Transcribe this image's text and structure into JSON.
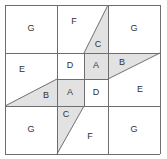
{
  "figure": {
    "name": "pinwheel-dissection-puzzle",
    "background_color": "#ffffff",
    "line_color": "#6e6e6e",
    "shade_color": "#e2e2e2",
    "label_color": "#333333",
    "frame": {
      "x0": 5,
      "y0": 5,
      "x1": 160,
      "y1": 154
    },
    "grid": {
      "vertical_x": [
        5,
        57,
        108,
        160
      ],
      "horizontal_y": [
        5,
        53,
        106,
        154
      ],
      "inner_vertical_x": [
        84
      ],
      "inner_horizontal_y": [
        79
      ]
    }
  },
  "pieces": [
    {
      "id": "g-top-left",
      "label": "G",
      "shaded": false,
      "lx": 31,
      "ly": 29,
      "points": "5,5 57,5 57,53 5,53"
    },
    {
      "id": "f-top",
      "label": "F",
      "shaded": false,
      "lx": 74,
      "ly": 22,
      "points": "57,5 108,5 84,53 57,53"
    },
    {
      "id": "c-top",
      "label": "C",
      "shaded": true,
      "lx": 98,
      "ly": 45,
      "points": "108,5 108,53 84,53"
    },
    {
      "id": "g-top-right",
      "label": "G",
      "shaded": false,
      "lx": 134,
      "ly": 29,
      "points": "108,5 160,5 160,53 108,53"
    },
    {
      "id": "e-left",
      "label": "E",
      "shaded": false,
      "lx": 22,
      "ly": 70,
      "points": "5,53 57,53 57,79 5,106"
    },
    {
      "id": "d-upper",
      "label": "D",
      "shaded": false,
      "lx": 70,
      "ly": 66,
      "points": "57,53 84,53 84,79 57,79"
    },
    {
      "id": "a-upper",
      "label": "A",
      "shaded": true,
      "lx": 96,
      "ly": 66,
      "points": "84,53 108,53 108,79 84,79"
    },
    {
      "id": "b-right",
      "label": "B",
      "shaded": true,
      "lx": 122,
      "ly": 63,
      "points": "108,53 160,53 108,79"
    },
    {
      "id": "b-left",
      "label": "B",
      "shaded": true,
      "lx": 46,
      "ly": 96,
      "points": "5,106 57,79 57,106"
    },
    {
      "id": "a-lower",
      "label": "A",
      "shaded": true,
      "lx": 70,
      "ly": 93,
      "points": "57,79 84,79 84,106 57,106"
    },
    {
      "id": "d-lower",
      "label": "D",
      "shaded": false,
      "lx": 96,
      "ly": 93,
      "points": "84,79 108,79 108,106 84,106"
    },
    {
      "id": "e-right",
      "label": "E",
      "shaded": false,
      "lx": 140,
      "ly": 90,
      "points": "108,79 160,53 160,106 108,106"
    },
    {
      "id": "g-bottom-left",
      "label": "G",
      "shaded": false,
      "lx": 31,
      "ly": 130,
      "points": "5,106 57,106 57,154 5,154"
    },
    {
      "id": "c-bottom",
      "label": "C",
      "shaded": true,
      "lx": 66,
      "ly": 115,
      "points": "57,106 84,106 57,154"
    },
    {
      "id": "f-bottom",
      "label": "F",
      "shaded": false,
      "lx": 90,
      "ly": 137,
      "points": "84,106 108,106 108,154 57,154"
    },
    {
      "id": "g-bottom-right",
      "label": "G",
      "shaded": false,
      "lx": 134,
      "ly": 130,
      "points": "108,106 160,106 160,154 108,154"
    }
  ],
  "grid_lines": [
    {
      "id": "frame-top",
      "x1": 5,
      "y1": 5,
      "x2": 160,
      "y2": 5
    },
    {
      "id": "frame-bottom",
      "x1": 5,
      "y1": 154,
      "x2": 160,
      "y2": 154
    },
    {
      "id": "frame-left",
      "x1": 5,
      "y1": 5,
      "x2": 5,
      "y2": 154
    },
    {
      "id": "frame-right",
      "x1": 160,
      "y1": 5,
      "x2": 160,
      "y2": 154
    },
    {
      "id": "h-upper",
      "x1": 5,
      "y1": 53,
      "x2": 160,
      "y2": 53
    },
    {
      "id": "h-lower",
      "x1": 5,
      "y1": 106,
      "x2": 160,
      "y2": 106
    },
    {
      "id": "v-left",
      "x1": 57,
      "y1": 5,
      "x2": 57,
      "y2": 154
    },
    {
      "id": "v-right",
      "x1": 108,
      "y1": 5,
      "x2": 108,
      "y2": 154
    },
    {
      "id": "v-center",
      "x1": 84,
      "y1": 53,
      "x2": 84,
      "y2": 106
    },
    {
      "id": "h-center-left",
      "x1": 57,
      "y1": 79,
      "x2": 84,
      "y2": 79
    },
    {
      "id": "h-center-right",
      "x1": 84,
      "y1": 79,
      "x2": 108,
      "y2": 79
    }
  ],
  "diagonals": [
    {
      "id": "diag-top",
      "x1": 108,
      "y1": 5,
      "x2": 84,
      "y2": 53
    },
    {
      "id": "diag-right",
      "x1": 108,
      "y1": 79,
      "x2": 160,
      "y2": 53
    },
    {
      "id": "diag-left",
      "x1": 5,
      "y1": 106,
      "x2": 57,
      "y2": 79
    },
    {
      "id": "diag-bottom",
      "x1": 57,
      "y1": 154,
      "x2": 84,
      "y2": 106
    }
  ]
}
